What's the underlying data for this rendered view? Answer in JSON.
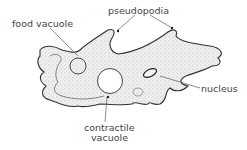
{
  "diagram": {
    "labels": {
      "food_vacuole": "food vacuole",
      "pseudopodia": "pseudopodia",
      "nucleus": "nucleus",
      "contractile_vacuole_line1": "contractile",
      "contractile_vacuole_line2": "vacuole"
    },
    "colors": {
      "outline": "#333333",
      "stipple": "#9a9a9a",
      "text": "#444444",
      "background": "#ffffff"
    }
  }
}
